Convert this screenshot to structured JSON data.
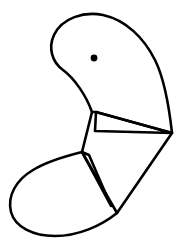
{
  "figure": {
    "canvas": {
      "width": 185,
      "height": 250,
      "background_color": "#ffffff"
    },
    "style": {
      "stroke_color": "#000000",
      "fill_color": "none",
      "stroke_width": 2.6,
      "eye_fill_color": "#000000"
    },
    "shapes": [
      {
        "name": "upper-lobe",
        "type": "closed-path",
        "path": "M 92 112 C 86 95 74 78 63 70 C 52 62 48 48 54 35 C 62 18 84 11 103 15 C 126 20 144 38 155 60 C 164 78 169 106 172 133 L 96 112 Z"
      },
      {
        "name": "beak-wedge",
        "type": "closed-path",
        "path": "M 96 112 L 172 133 L 95 131 Z"
      },
      {
        "name": "neck-connector",
        "type": "open-path",
        "path": "M 92 112 L 82 152"
      },
      {
        "name": "lower-lobe",
        "type": "closed-path",
        "path": "M 82 152 C 66 156 46 162 33 170 C 16 180 7 196 11 212 C 15 227 33 236 55 236 C 78 236 101 226 117 213 Z"
      },
      {
        "name": "lower-sliver-wedge",
        "type": "closed-path",
        "path": "M 82 152 L 111 206 L 89 155 Z"
      },
      {
        "name": "right-diagonal-edge",
        "type": "open-path",
        "path": "M 172 133 L 117 213"
      },
      {
        "name": "eye-dot",
        "type": "circle",
        "cx": 94,
        "cy": 58,
        "r": 3.4
      }
    ]
  }
}
